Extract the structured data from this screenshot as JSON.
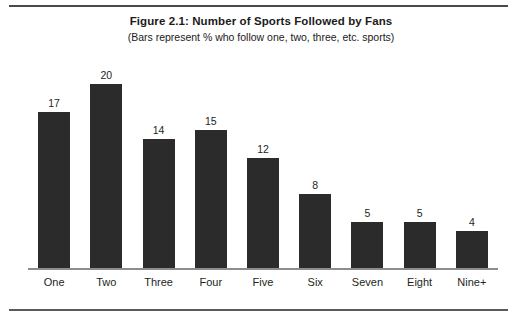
{
  "figure": {
    "title": "Figure 2.1: Number of Sports Followed by Fans",
    "subtitle": "(Bars represent % who follow one, two, three, etc. sports)"
  },
  "colors": {
    "bar": "#2b2b2b",
    "text": "#231f20",
    "rule": "#4a4a4a",
    "axis": "#8d8d8d",
    "background": "#ffffff"
  },
  "chart_data": {
    "type": "bar",
    "title": "Figure 2.1: Number of Sports Followed by Fans",
    "subtitle": "(Bars represent % who follow one, two, three, etc. sports)",
    "xlabel": "",
    "ylabel": "",
    "ylim": [
      0,
      20
    ],
    "grid": false,
    "legend": false,
    "data_labels": true,
    "categories": [
      "One",
      "Two",
      "Three",
      "Four",
      "Five",
      "Six",
      "Seven",
      "Eight",
      "Nine+"
    ],
    "values": [
      17,
      20,
      14,
      15,
      12,
      8,
      5,
      5,
      4
    ],
    "value_labels": [
      "17",
      "20",
      "14",
      "15",
      "12",
      "8",
      "5",
      "5",
      "4"
    ]
  }
}
